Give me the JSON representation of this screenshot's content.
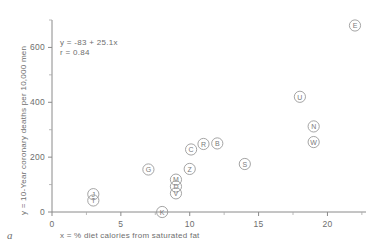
{
  "figure": {
    "panel_label": "a"
  },
  "chart_data": {
    "type": "scatter",
    "title": "",
    "xlabel": "x = % diet calories from saturated fat",
    "ylabel": "y = 10-Year coronary deaths per 10,000 men",
    "xlim": [
      0,
      22.8
    ],
    "ylim": [
      0,
      700
    ],
    "xticks": [
      0,
      5,
      10,
      15,
      20
    ],
    "xtick_labels": [
      "0",
      "5",
      "10",
      "15",
      "20"
    ],
    "yticks": [
      0,
      200,
      400,
      600
    ],
    "ytick_labels": [
      "0",
      "200",
      "400",
      "600"
    ],
    "x_minor_step": 2.5,
    "y_minor_step": 100,
    "grid": false,
    "legend": "none",
    "marker_style": "circled-letter",
    "annotations": [
      "y = -83 + 25.1x",
      "r = 0.84"
    ],
    "regression": {
      "intercept": -83,
      "slope": 25.1,
      "r": 0.84
    },
    "points": [
      {
        "label": "J",
        "x": 3.0,
        "y": 65
      },
      {
        "label": "T",
        "x": 3.0,
        "y": 42
      },
      {
        "label": "G",
        "x": 7.0,
        "y": 155
      },
      {
        "label": "K",
        "x": 8.0,
        "y": 0
      },
      {
        "label": "M",
        "x": 9.0,
        "y": 118
      },
      {
        "label": "D",
        "x": 9.0,
        "y": 93
      },
      {
        "label": "V",
        "x": 9.0,
        "y": 68
      },
      {
        "label": "Z",
        "x": 10.0,
        "y": 157
      },
      {
        "label": "C",
        "x": 10.1,
        "y": 228
      },
      {
        "label": "R",
        "x": 11.0,
        "y": 248
      },
      {
        "label": "B",
        "x": 12.0,
        "y": 250
      },
      {
        "label": "S",
        "x": 14.0,
        "y": 175
      },
      {
        "label": "U",
        "x": 18.0,
        "y": 420
      },
      {
        "label": "N",
        "x": 19.0,
        "y": 312
      },
      {
        "label": "W",
        "x": 19.0,
        "y": 255
      },
      {
        "label": "E",
        "x": 22.0,
        "y": 680
      }
    ]
  }
}
